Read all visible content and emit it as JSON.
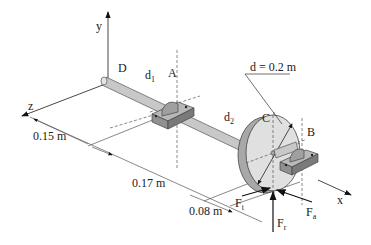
{
  "figure": {
    "axes": {
      "x": "x",
      "y": "y",
      "z": "z"
    },
    "points": {
      "D": "D",
      "A": "A",
      "B": "B",
      "C": "C"
    },
    "diameters": {
      "d1": {
        "main": "d",
        "sub": "1"
      },
      "d2": {
        "main": "d",
        "sub": "2"
      },
      "gear_diameter": "d = 0.2 m"
    },
    "dimensions": {
      "dim_DA": "0.15 m",
      "dim_AC": "0.17 m",
      "dim_CB": "0.08 m"
    },
    "forces": {
      "Ft": {
        "main": "F",
        "sub": "t"
      },
      "Fr": {
        "main": "F",
        "sub": "r"
      },
      "Fa": {
        "main": "F",
        "sub": "a"
      }
    },
    "colors": {
      "shaft": "#c8c8c8",
      "gear_face": "#e0e0e0",
      "gear_rim": "#a8a8a8",
      "bearing": "#9a9a9a",
      "line": "#333333"
    }
  }
}
